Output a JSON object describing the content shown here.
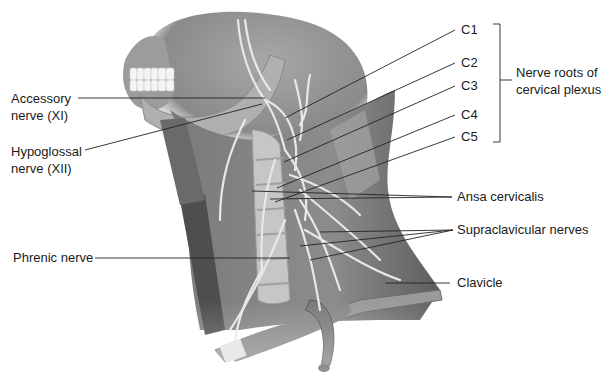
{
  "figure": {
    "style": "grayscale anatomical illustration"
  },
  "labels": {
    "left": [
      {
        "id": "accessory",
        "line1": "Accessory",
        "line2": "nerve (XI)"
      },
      {
        "id": "hypoglossal",
        "line1": "Hypoglossal",
        "line2": "nerve (XII)"
      },
      {
        "id": "phrenic",
        "text": "Phrenic nerve"
      }
    ],
    "roots": [
      "C1",
      "C2",
      "C3",
      "C4",
      "C5"
    ],
    "bracket": {
      "line1": "Nerve roots of",
      "line2": "cervical plexus"
    },
    "right": [
      {
        "id": "ansa",
        "text": "Ansa cervicalis"
      },
      {
        "id": "supraclavicular",
        "text": "Supraclavicular nerves"
      },
      {
        "id": "clavicle",
        "text": "Clavicle"
      }
    ]
  },
  "colors": {
    "background": "#ffffff",
    "text": "#1a1a1a",
    "leader_lines": "#222222",
    "skin_dark": "#6e6e6e",
    "skin_mid": "#9a9a9a",
    "bone_light": "#d4d4d4",
    "nerve": "#e6e6e6",
    "muscle": "#555555"
  }
}
